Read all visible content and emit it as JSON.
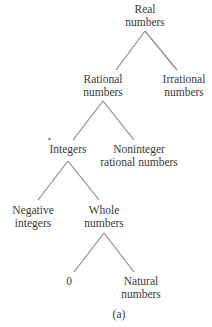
{
  "diagram": {
    "type": "tree",
    "caption": "(a)",
    "nodes": [
      {
        "id": "real",
        "line1": "Real",
        "line2": "numbers",
        "x": 145,
        "y": 3
      },
      {
        "id": "rational",
        "line1": "Rational",
        "line2": "numbers",
        "x": 103,
        "y": 73
      },
      {
        "id": "irrational",
        "line1": "Irrational",
        "line2": "numbers",
        "x": 184,
        "y": 73
      },
      {
        "id": "integers",
        "line1": "Integers",
        "line2": "",
        "x": 68,
        "y": 143
      },
      {
        "id": "noninteger",
        "line1": "Noninteger",
        "line2": "rational numbers",
        "x": 139,
        "y": 143
      },
      {
        "id": "negative",
        "line1": "Negative",
        "line2": "integers",
        "x": 33,
        "y": 204
      },
      {
        "id": "whole",
        "line1": "Whole",
        "line2": "numbers",
        "x": 104,
        "y": 204
      },
      {
        "id": "zero",
        "line1": "0",
        "line2": "",
        "x": 69,
        "y": 275
      },
      {
        "id": "natural",
        "line1": "Natural",
        "line2": "numbers",
        "x": 141,
        "y": 275
      }
    ],
    "edges": [
      {
        "from": "real",
        "to": "rational",
        "x1": 145,
        "y1": 31,
        "x2": 116,
        "y2": 70
      },
      {
        "from": "real",
        "to": "irrational",
        "x1": 145,
        "y1": 31,
        "x2": 177,
        "y2": 70
      },
      {
        "from": "rational",
        "to": "integers",
        "x1": 103,
        "y1": 101,
        "x2": 73,
        "y2": 140
      },
      {
        "from": "rational",
        "to": "noninteger",
        "x1": 103,
        "y1": 101,
        "x2": 134,
        "y2": 140
      },
      {
        "from": "integers",
        "to": "negative",
        "x1": 68,
        "y1": 161,
        "x2": 38,
        "y2": 200
      },
      {
        "from": "integers",
        "to": "whole",
        "x1": 68,
        "y1": 161,
        "x2": 99,
        "y2": 200
      },
      {
        "from": "whole",
        "to": "zero",
        "x1": 104,
        "y1": 233,
        "x2": 74,
        "y2": 272
      },
      {
        "from": "whole",
        "to": "natural",
        "x1": 104,
        "y1": 233,
        "x2": 134,
        "y2": 272
      }
    ]
  }
}
